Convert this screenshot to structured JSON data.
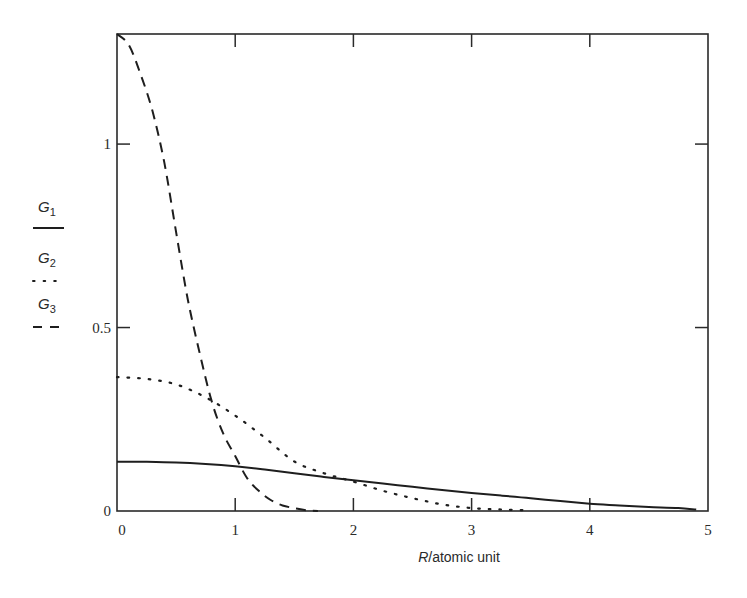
{
  "chart_data": {
    "type": "line",
    "title": "",
    "xlabel": "R/atomic unit",
    "xlabel_italic_part": "R",
    "xlabel_rest": "/atomic unit",
    "ylabel": "",
    "xlim": [
      0,
      5
    ],
    "ylim": [
      0,
      1.3
    ],
    "x_ticks": [
      0,
      1,
      2,
      3,
      4,
      5
    ],
    "x_tick_labels": [
      "0",
      "1",
      "2",
      "3",
      "4",
      "5"
    ],
    "y_ticks": [
      0,
      0.5,
      1
    ],
    "y_tick_labels": [
      "0",
      "0.5",
      "1"
    ],
    "grid": false,
    "frame": "box",
    "legend_position": "left, outside plot",
    "series": [
      {
        "name": "G1",
        "symbol": "G",
        "subscript": "1",
        "style": "solid",
        "x": [
          0,
          0.25,
          0.5,
          0.75,
          1.0,
          1.25,
          1.5,
          1.75,
          2.0,
          2.25,
          2.5,
          2.75,
          3.0,
          3.25,
          3.5,
          3.75,
          4.0,
          4.25,
          4.5,
          4.75,
          4.9
        ],
        "values": [
          0.134,
          0.134,
          0.132,
          0.128,
          0.122,
          0.113,
          0.103,
          0.093,
          0.084,
          0.075,
          0.066,
          0.057,
          0.049,
          0.042,
          0.035,
          0.027,
          0.02,
          0.015,
          0.011,
          0.008,
          0.004
        ]
      },
      {
        "name": "G2",
        "symbol": "G",
        "subscript": "2",
        "style": "dotted",
        "x": [
          0,
          0.25,
          0.5,
          0.75,
          1.0,
          1.25,
          1.5,
          1.75,
          2.0,
          2.25,
          2.5,
          2.75,
          3.0,
          3.25,
          3.5
        ],
        "values": [
          0.365,
          0.36,
          0.345,
          0.31,
          0.26,
          0.2,
          0.135,
          0.103,
          0.08,
          0.055,
          0.035,
          0.018,
          0.008,
          0.004,
          0.002
        ]
      },
      {
        "name": "G3",
        "symbol": "G",
        "subscript": "3",
        "style": "dashed",
        "x": [
          0,
          0.1,
          0.2,
          0.3,
          0.4,
          0.5,
          0.6,
          0.7,
          0.8,
          0.9,
          1.0,
          1.1,
          1.2,
          1.3,
          1.4,
          1.5,
          1.6,
          1.7
        ],
        "values": [
          1.3,
          1.27,
          1.19,
          1.09,
          0.95,
          0.76,
          0.575,
          0.43,
          0.3,
          0.21,
          0.15,
          0.09,
          0.055,
          0.03,
          0.015,
          0.008,
          0.002,
          0.0
        ]
      }
    ]
  },
  "colors": {
    "line": "#1e1e1e",
    "frame": "#2a2a2a",
    "background": "#ffffff"
  }
}
